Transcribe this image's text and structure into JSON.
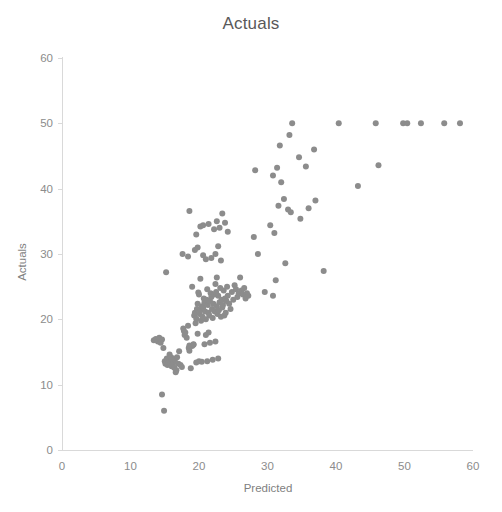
{
  "chart_data": {
    "type": "scatter",
    "title": "Actuals",
    "xlabel": "Predicted",
    "ylabel": "Actuals",
    "xlim": [
      0,
      60
    ],
    "ylim": [
      0,
      60
    ],
    "xticks": [
      0,
      10,
      20,
      30,
      40,
      50,
      60
    ],
    "yticks": [
      0,
      10,
      20,
      30,
      40,
      50,
      60
    ],
    "grid": false,
    "legend": false,
    "marker_color": "#8c8c8c",
    "marker_size": 6,
    "series": [
      {
        "name": "Actuals vs Predicted",
        "points": [
          [
            14.6,
            8.5
          ],
          [
            14.9,
            6.0
          ],
          [
            13.4,
            16.8
          ],
          [
            13.7,
            17.0
          ],
          [
            14.0,
            16.6
          ],
          [
            14.2,
            17.2
          ],
          [
            14.4,
            16.4
          ],
          [
            14.6,
            16.9
          ],
          [
            14.8,
            15.6
          ],
          [
            15.0,
            13.6
          ],
          [
            15.1,
            13.2
          ],
          [
            15.3,
            14.0
          ],
          [
            15.4,
            13.0
          ],
          [
            15.5,
            13.9
          ],
          [
            15.6,
            13.3
          ],
          [
            15.7,
            14.6
          ],
          [
            15.8,
            13.1
          ],
          [
            15.9,
            14.2
          ],
          [
            16.0,
            12.8
          ],
          [
            16.1,
            13.6
          ],
          [
            16.2,
            14.0
          ],
          [
            16.3,
            13.4
          ],
          [
            16.4,
            12.6
          ],
          [
            16.5,
            13.9
          ],
          [
            16.6,
            11.9
          ],
          [
            16.7,
            12.2
          ],
          [
            16.8,
            14.2
          ],
          [
            17.0,
            13.2
          ],
          [
            17.1,
            15.1
          ],
          [
            17.3,
            13.0
          ],
          [
            17.5,
            12.7
          ],
          [
            17.7,
            18.6
          ],
          [
            17.8,
            18.2
          ],
          [
            17.9,
            17.6
          ],
          [
            18.0,
            18.0
          ],
          [
            18.2,
            17.2
          ],
          [
            18.4,
            19.0
          ],
          [
            18.5,
            15.6
          ],
          [
            18.6,
            15.2
          ],
          [
            18.8,
            12.5
          ],
          [
            19.0,
            15.9
          ],
          [
            19.2,
            16.2
          ],
          [
            19.3,
            20.6
          ],
          [
            19.4,
            21.0
          ],
          [
            19.5,
            19.4
          ],
          [
            19.6,
            20.1
          ],
          [
            19.7,
            21.6
          ],
          [
            19.8,
            22.4
          ],
          [
            19.9,
            24.1
          ],
          [
            20.0,
            23.8
          ],
          [
            20.1,
            20.8
          ],
          [
            20.2,
            21.4
          ],
          [
            20.3,
            19.8
          ],
          [
            20.4,
            22.0
          ],
          [
            20.5,
            20.4
          ],
          [
            20.6,
            21.8
          ],
          [
            20.7,
            23.2
          ],
          [
            20.8,
            22.6
          ],
          [
            20.9,
            21.2
          ],
          [
            21.0,
            20.0
          ],
          [
            21.1,
            23.0
          ],
          [
            21.2,
            24.6
          ],
          [
            21.3,
            22.2
          ],
          [
            21.4,
            21.0
          ],
          [
            21.5,
            20.6
          ],
          [
            21.6,
            22.8
          ],
          [
            21.7,
            24.0
          ],
          [
            21.8,
            23.4
          ],
          [
            21.9,
            21.6
          ],
          [
            22.0,
            20.2
          ],
          [
            22.1,
            22.4
          ],
          [
            22.2,
            23.8
          ],
          [
            22.3,
            21.2
          ],
          [
            22.4,
            25.4
          ],
          [
            22.5,
            24.2
          ],
          [
            22.6,
            22.0
          ],
          [
            22.7,
            20.8
          ],
          [
            22.8,
            23.6
          ],
          [
            22.9,
            21.4
          ],
          [
            23.0,
            22.6
          ],
          [
            23.1,
            24.8
          ],
          [
            23.2,
            20.4
          ],
          [
            23.3,
            23.0
          ],
          [
            23.4,
            21.8
          ],
          [
            23.5,
            22.2
          ],
          [
            23.6,
            24.4
          ],
          [
            23.7,
            20.6
          ],
          [
            23.8,
            23.2
          ],
          [
            23.9,
            21.0
          ],
          [
            24.0,
            22.8
          ],
          [
            24.1,
            25.0
          ],
          [
            24.2,
            23.6
          ],
          [
            24.4,
            22.4
          ],
          [
            24.6,
            21.6
          ],
          [
            24.8,
            24.2
          ],
          [
            25.0,
            23.0
          ],
          [
            25.2,
            25.2
          ],
          [
            25.4,
            24.6
          ],
          [
            25.6,
            23.4
          ],
          [
            25.8,
            24.0
          ],
          [
            26.0,
            26.4
          ],
          [
            26.2,
            24.4
          ],
          [
            26.4,
            23.8
          ],
          [
            26.6,
            24.8
          ],
          [
            26.8,
            23.2
          ],
          [
            27.0,
            24.0
          ],
          [
            27.2,
            23.6
          ],
          [
            18.6,
            16.0
          ],
          [
            19.2,
            16.1
          ],
          [
            19.6,
            13.4
          ],
          [
            20.0,
            13.6
          ],
          [
            20.4,
            13.5
          ],
          [
            20.8,
            16.2
          ],
          [
            21.2,
            13.6
          ],
          [
            21.6,
            16.4
          ],
          [
            22.0,
            13.8
          ],
          [
            22.4,
            16.6
          ],
          [
            22.8,
            14.0
          ],
          [
            21.0,
            17.6
          ],
          [
            21.4,
            18.0
          ],
          [
            19.8,
            17.8
          ],
          [
            15.2,
            27.2
          ],
          [
            20.2,
            26.2
          ],
          [
            22.6,
            26.4
          ],
          [
            19.0,
            25.0
          ],
          [
            17.6,
            30.0
          ],
          [
            18.4,
            29.6
          ],
          [
            19.4,
            30.6
          ],
          [
            19.8,
            31.0
          ],
          [
            20.6,
            29.8
          ],
          [
            21.0,
            29.2
          ],
          [
            21.8,
            29.4
          ],
          [
            22.4,
            30.0
          ],
          [
            22.8,
            31.2
          ],
          [
            23.2,
            29.0
          ],
          [
            19.6,
            33.0
          ],
          [
            20.2,
            34.2
          ],
          [
            20.6,
            34.4
          ],
          [
            21.4,
            34.6
          ],
          [
            22.2,
            33.8
          ],
          [
            22.6,
            35.0
          ],
          [
            23.0,
            34.0
          ],
          [
            23.4,
            36.2
          ],
          [
            23.8,
            34.8
          ],
          [
            24.2,
            33.4
          ],
          [
            18.6,
            36.6
          ],
          [
            28.2,
            42.8
          ],
          [
            28.0,
            32.6
          ],
          [
            28.6,
            30.0
          ],
          [
            29.6,
            24.2
          ],
          [
            30.8,
            23.6
          ],
          [
            31.2,
            26.0
          ],
          [
            30.4,
            34.4
          ],
          [
            31.0,
            33.2
          ],
          [
            31.6,
            37.4
          ],
          [
            32.4,
            38.4
          ],
          [
            33.0,
            36.8
          ],
          [
            33.4,
            36.4
          ],
          [
            32.0,
            41.0
          ],
          [
            31.4,
            43.2
          ],
          [
            30.8,
            42.0
          ],
          [
            31.8,
            46.6
          ],
          [
            33.2,
            48.2
          ],
          [
            33.6,
            50.0
          ],
          [
            34.6,
            44.8
          ],
          [
            35.6,
            43.4
          ],
          [
            36.8,
            46.0
          ],
          [
            37.0,
            38.2
          ],
          [
            36.0,
            37.0
          ],
          [
            34.8,
            35.4
          ],
          [
            38.2,
            27.4
          ],
          [
            32.6,
            28.6
          ],
          [
            40.4,
            50.0
          ],
          [
            45.8,
            50.0
          ],
          [
            49.8,
            50.0
          ],
          [
            50.4,
            50.0
          ],
          [
            52.4,
            50.0
          ],
          [
            55.8,
            50.0
          ],
          [
            58.1,
            50.0
          ],
          [
            46.2,
            43.6
          ],
          [
            43.2,
            40.4
          ]
        ]
      }
    ]
  },
  "axes": {
    "y_tick_labels": [
      "60",
      "50",
      "40",
      "30",
      "20",
      "10",
      "0"
    ],
    "x_tick_labels": [
      "0",
      "10",
      "20",
      "30",
      "40",
      "50",
      "60"
    ]
  }
}
